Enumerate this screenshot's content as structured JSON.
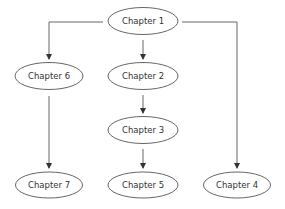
{
  "diagram": {
    "type": "flowchart",
    "stroke_color": "#444444",
    "background": "#ffffff",
    "nodes": [
      {
        "id": "ch1",
        "label": "Chapter 1",
        "cx": 143,
        "cy": 21
      },
      {
        "id": "ch6",
        "label": "Chapter 6",
        "cx": 49,
        "cy": 76
      },
      {
        "id": "ch2",
        "label": "Chapter 2",
        "cx": 143,
        "cy": 76
      },
      {
        "id": "ch3",
        "label": "Chapter 3",
        "cx": 143,
        "cy": 130
      },
      {
        "id": "ch7",
        "label": "Chapter 7",
        "cx": 49,
        "cy": 185
      },
      {
        "id": "ch5",
        "label": "Chapter 5",
        "cx": 143,
        "cy": 185
      },
      {
        "id": "ch4",
        "label": "Chapter 4",
        "cx": 237,
        "cy": 185
      }
    ],
    "edges": [
      {
        "from": "ch1",
        "to": "ch6"
      },
      {
        "from": "ch1",
        "to": "ch2"
      },
      {
        "from": "ch1",
        "to": "ch4"
      },
      {
        "from": "ch2",
        "to": "ch3"
      },
      {
        "from": "ch3",
        "to": "ch5"
      },
      {
        "from": "ch6",
        "to": "ch7"
      }
    ]
  }
}
